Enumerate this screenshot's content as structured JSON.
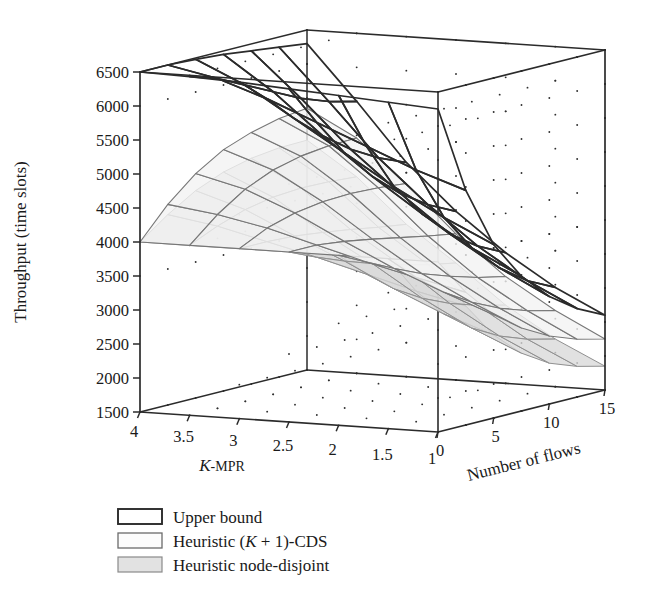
{
  "figure": {
    "kind": "3d-surface-mesh-plot",
    "background": "#ffffff",
    "line_color": "#2b2b2b"
  },
  "axes": {
    "z": {
      "title": "Throughput (time slots)",
      "ticks": [
        "6500",
        "6000",
        "5500",
        "5000",
        "4500",
        "4000",
        "3500",
        "3000",
        "2500",
        "2000",
        "1500"
      ],
      "values": [
        6500,
        6000,
        5500,
        5000,
        4500,
        4000,
        3500,
        3000,
        2500,
        2000,
        1500
      ],
      "range": [
        1500,
        6500
      ]
    },
    "x": {
      "title_k": "K",
      "title_rest": "-MPR",
      "title": "K-MPR",
      "ticks": [
        "4",
        "3.5",
        "3",
        "2.5",
        "2",
        "1.5",
        "1"
      ],
      "values": [
        4,
        3.5,
        3,
        2.5,
        2,
        1.5,
        1
      ],
      "range": [
        1,
        4
      ]
    },
    "y": {
      "title": "Number of flows",
      "ticks": [
        "0",
        "5",
        "10",
        "15"
      ],
      "values": [
        0,
        5,
        10,
        15
      ],
      "range": [
        0,
        15
      ]
    }
  },
  "legend": {
    "items": [
      {
        "label": "Upper bound",
        "fill": "#ffffff",
        "stroke": "#2b2b2b",
        "stroke_width": 1.9
      },
      {
        "label_pre": "Heuristic (",
        "label_k": "K",
        "label_post": " + 1)-CDS",
        "label": "Heuristic (K + 1)-CDS",
        "fill": "#fcfcfc",
        "stroke": "#6b6b6b",
        "stroke_width": 1.3
      },
      {
        "label": "Heuristic node-disjoint",
        "fill": "#e2e2e2",
        "stroke": "#8a8a8a",
        "stroke_width": 1.2
      }
    ]
  },
  "chart_data": {
    "type": "surface",
    "title": "",
    "xlabel": "K-MPR",
    "ylabel": "Number of flows",
    "zlabel": "Throughput (time slots)",
    "xlim": [
      1,
      4
    ],
    "ylim": [
      0,
      15
    ],
    "zlim": [
      1500,
      6500
    ],
    "grid": true,
    "legend_position": "below-left",
    "x_grid": [
      4,
      3.5,
      3,
      2.5,
      2,
      1.5,
      1
    ],
    "y_grid": [
      0,
      2.5,
      5,
      7.5,
      10,
      12.5,
      15
    ],
    "series": [
      {
        "name": "Upper bound",
        "z": [
          [
            6500,
            6500,
            6480,
            6450,
            6400,
            6350,
            6300
          ],
          [
            6480,
            6350,
            6150,
            5950,
            5750,
            5600,
            5500
          ],
          [
            6450,
            6100,
            5700,
            5350,
            5050,
            4820,
            4650
          ],
          [
            6400,
            5800,
            5250,
            4800,
            4450,
            4180,
            3980
          ],
          [
            6350,
            5500,
            4800,
            4300,
            3900,
            3620,
            3420
          ],
          [
            6300,
            5200,
            4400,
            3850,
            3450,
            3160,
            2960
          ],
          [
            6250,
            4950,
            4050,
            3480,
            3080,
            2800,
            2600
          ]
        ]
      },
      {
        "name": "Heuristic (K + 1)-CDS",
        "z": [
          [
            4000,
            4450,
            4800,
            5050,
            5200,
            5300,
            5350
          ],
          [
            4000,
            4350,
            4620,
            4800,
            4900,
            4950,
            4960
          ],
          [
            4000,
            4200,
            4320,
            4380,
            4400,
            4380,
            4340
          ],
          [
            4000,
            4000,
            3950,
            3880,
            3800,
            3720,
            3650
          ],
          [
            4000,
            3800,
            3600,
            3420,
            3280,
            3160,
            3070
          ],
          [
            4000,
            3620,
            3300,
            3050,
            2860,
            2720,
            2620
          ],
          [
            4000,
            3450,
            3020,
            2720,
            2500,
            2350,
            2250
          ]
        ]
      },
      {
        "name": "Heuristic node-disjoint",
        "z": [
          [
            4000,
            4300,
            4550,
            4720,
            4820,
            4870,
            4880
          ],
          [
            4000,
            4180,
            4320,
            4400,
            4430,
            4420,
            4390
          ],
          [
            4000,
            4000,
            3980,
            3930,
            3870,
            3800,
            3740
          ],
          [
            4000,
            3820,
            3660,
            3520,
            3400,
            3300,
            3220
          ],
          [
            4000,
            3620,
            3300,
            3060,
            2880,
            2750,
            2650
          ],
          [
            4000,
            3420,
            2980,
            2670,
            2450,
            2300,
            2200
          ],
          [
            4000,
            3250,
            2720,
            2350,
            2100,
            1950,
            1850
          ]
        ]
      }
    ]
  }
}
